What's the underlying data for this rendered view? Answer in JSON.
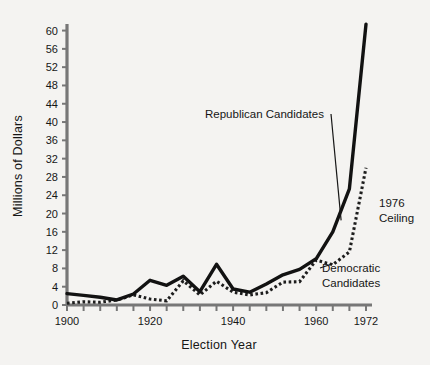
{
  "chart_data": {
    "type": "line",
    "title": "",
    "xlabel": "Election Year",
    "ylabel": "Millions of Dollars",
    "xlim": [
      1900,
      1972
    ],
    "ylim": [
      0,
      61
    ],
    "ytick_step": 4,
    "yticks": [
      0,
      4,
      8,
      12,
      16,
      20,
      24,
      28,
      32,
      36,
      40,
      44,
      48,
      52,
      56,
      60
    ],
    "ytick_labels": [
      "0",
      "4",
      "8",
      "12",
      "16",
      "20",
      "24",
      "28",
      "32",
      "36",
      "40",
      "44",
      "48",
      "52",
      "56",
      "60"
    ],
    "xticks": [
      1900,
      1904,
      1908,
      1912,
      1916,
      1920,
      1924,
      1928,
      1932,
      1936,
      1940,
      1944,
      1948,
      1952,
      1956,
      1960,
      1964,
      1968,
      1972
    ],
    "xtick_labels_shown": [
      "1900",
      "1920",
      "1940",
      "1960",
      "1972"
    ],
    "xtick_labels_values": [
      1900,
      1920,
      1940,
      1960,
      1972
    ],
    "grid": false,
    "legend_position": "inline-annotations",
    "x": [
      1900,
      1904,
      1908,
      1912,
      1916,
      1920,
      1924,
      1928,
      1932,
      1936,
      1940,
      1944,
      1948,
      1952,
      1956,
      1960,
      1964,
      1968,
      1972
    ],
    "series": [
      {
        "name": "Republican Candidates",
        "style": "solid",
        "color": "#121212",
        "values": [
          2.5,
          2.1,
          1.7,
          1.1,
          2.4,
          5.4,
          4.3,
          6.3,
          2.9,
          8.9,
          3.5,
          2.8,
          4.6,
          6.6,
          7.8,
          10.1,
          16.0,
          25.4,
          61.4
        ]
      },
      {
        "name": "Democratic Candidates",
        "style": "dotted",
        "color": "#1d1d1d",
        "values": [
          0.4,
          0.7,
          0.6,
          1.1,
          2.2,
          1.3,
          0.9,
          5.3,
          2.2,
          5.2,
          2.8,
          2.2,
          2.7,
          5.0,
          5.1,
          9.8,
          8.8,
          11.6,
          30.0
        ]
      }
    ],
    "annotations": [
      {
        "name": "republican-label",
        "text": "Republican Candidates",
        "anchor_year": 1966,
        "anchor_value": 18.5
      },
      {
        "name": "democratic-label",
        "text": "Democratic Candidates",
        "line1": "Democratic",
        "line2": "Candidates",
        "anchor_year": 1964,
        "anchor_value": 9.0
      },
      {
        "name": "ceiling-label",
        "text": "1976 Ceiling",
        "line1": "1976",
        "line2": "Ceiling",
        "anchor_year": 1971,
        "anchor_value": 22.0
      }
    ]
  },
  "axes": {
    "x_title": "Election Year",
    "y_title": "Millions of Dollars"
  },
  "colors": {
    "background": "#f4f3f1",
    "axis": "#6f6f6f",
    "ink": "#121212"
  }
}
